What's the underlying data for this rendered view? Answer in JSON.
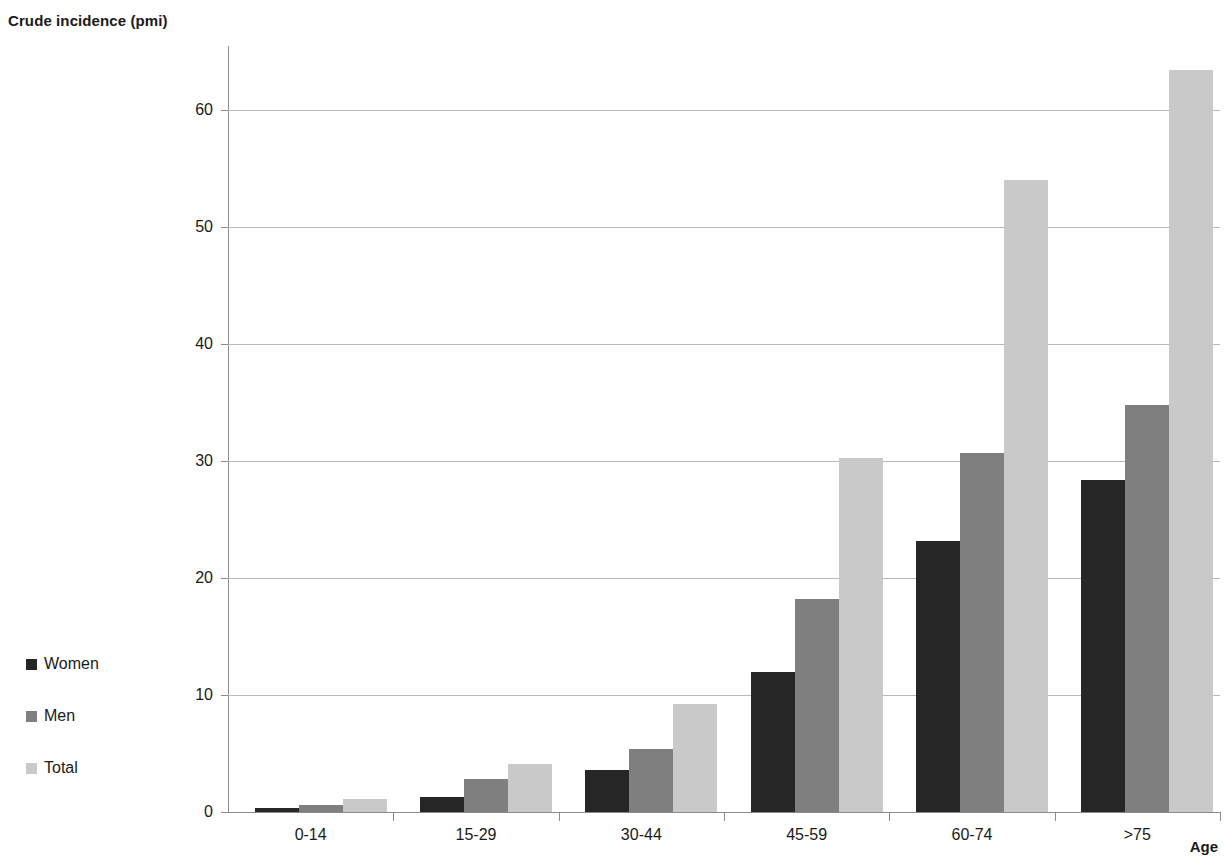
{
  "chart_data": {
    "type": "bar",
    "title": "Crude incidence (pmi)",
    "subtitle": "",
    "xlabel": "Age",
    "ylabel": "Crude incidence (pmi)",
    "categories": [
      "0-14",
      "15-29",
      "30-44",
      "45-59",
      "60-74",
      ">75"
    ],
    "series": [
      {
        "name": "Women",
        "color": "#262626",
        "values": [
          0.35,
          1.3,
          3.6,
          12.0,
          23.2,
          28.4
        ]
      },
      {
        "name": "Men",
        "color": "#7f7f7f",
        "values": [
          0.6,
          2.8,
          5.4,
          18.2,
          30.7,
          34.8
        ]
      },
      {
        "name": "Total",
        "color": "#c9c9c9",
        "values": [
          1.1,
          4.1,
          9.2,
          30.3,
          54.0,
          63.4
        ]
      }
    ],
    "ylim": [
      0,
      63.4
    ],
    "yticks": [
      0,
      10,
      20,
      30,
      40,
      50,
      60
    ],
    "ytick_labels": [
      "0",
      "10",
      "20",
      "30",
      "40",
      "50",
      "60"
    ],
    "grid": true,
    "grid_axis": "y",
    "legend_position": "left-middle"
  },
  "axis": {
    "y_title": "Crude incidence (pmi)",
    "x_title": "Age"
  },
  "legend": {
    "items": [
      {
        "label": "Women",
        "color": "#262626"
      },
      {
        "label": "Men",
        "color": "#7f7f7f"
      },
      {
        "label": "Total",
        "color": "#c9c9c9"
      }
    ]
  }
}
